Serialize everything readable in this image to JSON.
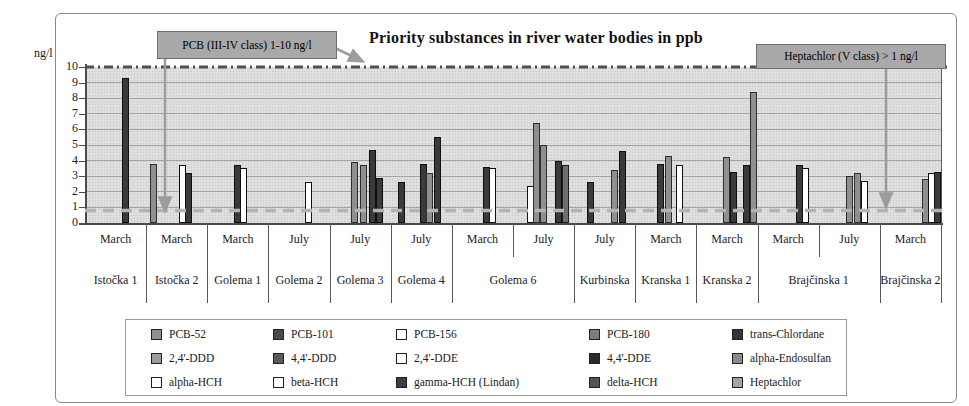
{
  "chart_data": {
    "type": "bar",
    "title": "Priority substances in river water bodies in ppb",
    "ylabel": "ng/l",
    "ylim": [
      0,
      10
    ],
    "yticks": [
      0,
      1,
      2,
      3,
      4,
      5,
      6,
      7,
      8,
      9,
      10
    ],
    "grid": true,
    "legend_position": "bottom",
    "annotations": [
      {
        "text": "PCB (III-IV class) 1-10 ng/l",
        "points_to": "10 ng/l dash-dot limit line and 1 ng/l dashed line"
      },
      {
        "text": "Heptachlor (V class) > 1 ng/l",
        "points_to": "1 ng/l dashed limit line"
      }
    ],
    "reference_lines": [
      {
        "value": 10,
        "style": "dash-dot",
        "color": "#4f4f4f"
      },
      {
        "value": 0.8,
        "style": "dashed",
        "color": "#b3b3b3"
      }
    ],
    "bar_colors": {
      "dark": "#3a3a3a",
      "gray": "#8f8f8f",
      "mid": "#6e6e6e",
      "white": "#ffffff"
    },
    "legend": [
      {
        "label": "PCB-52",
        "color": "#8f8f8f"
      },
      {
        "label": "PCB-101",
        "color": "#4a4a4a"
      },
      {
        "label": "PCB-156",
        "color": "#ffffff"
      },
      {
        "label": "PCB-180",
        "color": "#7d7d7d"
      },
      {
        "label": "trans-Chlordane",
        "color": "#353535"
      },
      {
        "label": "2,4'-DDD",
        "color": "#9b9b9b"
      },
      {
        "label": "4,4'-DDD",
        "color": "#5a5a5a"
      },
      {
        "label": "2,4'-DDE",
        "color": "#ffffff"
      },
      {
        "label": "4,4'-DDE",
        "color": "#2b2b2b"
      },
      {
        "label": "alpha-Endosulfan",
        "color": "#8a8a8a"
      },
      {
        "label": "alpha-HCH",
        "color": "#ffffff"
      },
      {
        "label": "beta-HCH",
        "color": "#ffffff"
      },
      {
        "label": "gamma-HCH (Lindan)",
        "color": "#3d3d3d"
      },
      {
        "label": "delta-HCH",
        "color": "#555555"
      },
      {
        "label": "Heptachlor",
        "color": "#a3a3a3"
      }
    ],
    "rivers": [
      {
        "label": "Istočka 1",
        "span": 1
      },
      {
        "label": "Istočka 2",
        "span": 1
      },
      {
        "label": "Golema 1",
        "span": 1
      },
      {
        "label": "Golema 2",
        "span": 1
      },
      {
        "label": "Golema 3",
        "span": 1
      },
      {
        "label": "Golema 4",
        "span": 1
      },
      {
        "label": "Golema 6",
        "span": 2
      },
      {
        "label": "Kurbinska",
        "span": 1
      },
      {
        "label": "Kranska 1",
        "span": 1
      },
      {
        "label": "Kranska 2",
        "span": 1
      },
      {
        "label": "Brajčinska 1",
        "span": 2
      },
      {
        "label": "Brajčinska 2",
        "span": 1
      }
    ],
    "groups": [
      {
        "month": "March",
        "river": "Istočka 1",
        "bars": [
          {
            "value": 9.3,
            "color": "dark",
            "pos": 0.66
          }
        ]
      },
      {
        "month": "March",
        "river": "Istočka 2",
        "bars": [
          {
            "value": 3.8,
            "color": "gray",
            "pos": 0.12
          },
          {
            "value": 3.7,
            "color": "white",
            "pos": 0.59
          },
          {
            "value": 3.2,
            "color": "dark",
            "pos": 0.7
          }
        ]
      },
      {
        "month": "March",
        "river": "Golema 1",
        "bars": [
          {
            "value": 3.7,
            "color": "dark",
            "pos": 0.49
          },
          {
            "value": 3.5,
            "color": "white",
            "pos": 0.6
          }
        ]
      },
      {
        "month": "July",
        "river": "Golema 2",
        "bars": [
          {
            "value": 2.6,
            "color": "white",
            "pos": 0.66
          }
        ]
      },
      {
        "month": "July",
        "river": "Golema 3",
        "bars": [
          {
            "value": 3.9,
            "color": "gray",
            "pos": 0.4
          },
          {
            "value": 3.7,
            "color": "gray",
            "pos": 0.55
          },
          {
            "value": 4.7,
            "color": "dark",
            "pos": 0.7
          },
          {
            "value": 2.9,
            "color": "dark",
            "pos": 0.82
          }
        ]
      },
      {
        "month": "July",
        "river": "Golema 4",
        "bars": [
          {
            "value": 2.6,
            "color": "dark",
            "pos": 0.18
          },
          {
            "value": 3.8,
            "color": "dark",
            "pos": 0.53
          },
          {
            "value": 3.2,
            "color": "gray",
            "pos": 0.64
          },
          {
            "value": 5.5,
            "color": "dark",
            "pos": 0.76
          }
        ]
      },
      {
        "month": "March",
        "river": "Golema 6",
        "bars": [
          {
            "value": 3.6,
            "color": "dark",
            "pos": 0.56
          },
          {
            "value": 3.5,
            "color": "white",
            "pos": 0.67
          }
        ]
      },
      {
        "month": "July",
        "river": "Golema 6",
        "bars": [
          {
            "value": 2.4,
            "color": "white",
            "pos": 0.28
          },
          {
            "value": 6.4,
            "color": "gray",
            "pos": 0.38
          },
          {
            "value": 5.0,
            "color": "gray",
            "pos": 0.5
          },
          {
            "value": 4.0,
            "color": "dark",
            "pos": 0.74
          },
          {
            "value": 3.7,
            "color": "mid",
            "pos": 0.86
          }
        ]
      },
      {
        "month": "July",
        "river": "Kurbinska",
        "bars": [
          {
            "value": 2.6,
            "color": "dark",
            "pos": 0.26
          },
          {
            "value": 3.4,
            "color": "gray",
            "pos": 0.66
          },
          {
            "value": 4.6,
            "color": "dark",
            "pos": 0.79
          }
        ]
      },
      {
        "month": "March",
        "river": "Kranska 1",
        "bars": [
          {
            "value": 3.8,
            "color": "dark",
            "pos": 0.42
          },
          {
            "value": 4.3,
            "color": "gray",
            "pos": 0.54
          },
          {
            "value": 3.7,
            "color": "white",
            "pos": 0.72
          }
        ]
      },
      {
        "month": "March",
        "river": "Kranska 2",
        "bars": [
          {
            "value": 4.2,
            "color": "gray",
            "pos": 0.49
          },
          {
            "value": 3.3,
            "color": "dark",
            "pos": 0.61
          },
          {
            "value": 3.7,
            "color": "dark",
            "pos": 0.82
          },
          {
            "value": 8.4,
            "color": "gray",
            "pos": 0.93
          }
        ]
      },
      {
        "month": "March",
        "river": "Brajčinska 1",
        "bars": [
          {
            "value": 3.7,
            "color": "dark",
            "pos": 0.69
          },
          {
            "value": 3.5,
            "color": "white",
            "pos": 0.79
          }
        ]
      },
      {
        "month": "July",
        "river": "Brajčinska 1",
        "bars": [
          {
            "value": 3.0,
            "color": "gray",
            "pos": 0.51
          },
          {
            "value": 3.2,
            "color": "gray",
            "pos": 0.63
          },
          {
            "value": 2.7,
            "color": "white",
            "pos": 0.75
          }
        ]
      },
      {
        "month": "March",
        "river": "Brajčinska 2",
        "bars": [
          {
            "value": 2.8,
            "color": "gray",
            "pos": 0.74
          },
          {
            "value": 3.2,
            "color": "white",
            "pos": 0.85
          },
          {
            "value": 3.3,
            "color": "dark",
            "pos": 0.94
          }
        ]
      }
    ]
  }
}
